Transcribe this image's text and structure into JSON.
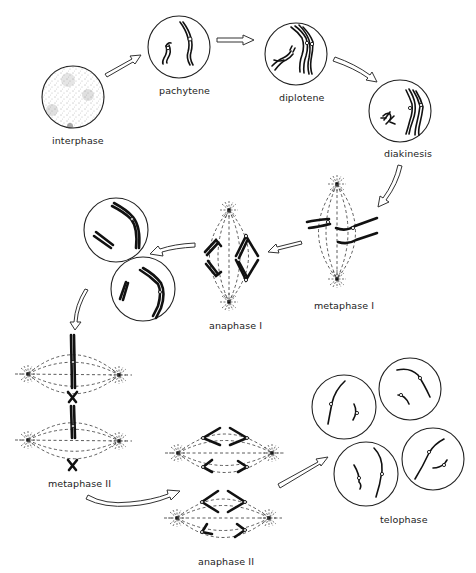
{
  "diagram": {
    "stages": [
      {
        "id": "interphase",
        "label": "interphase"
      },
      {
        "id": "pachytene",
        "label": "pachytene"
      },
      {
        "id": "diplotene",
        "label": "diplotene"
      },
      {
        "id": "diakinesis",
        "label": "diakinesis"
      },
      {
        "id": "metaphase-1",
        "label": "metaphase I"
      },
      {
        "id": "anaphase-1",
        "label": "anaphase I"
      },
      {
        "id": "metaphase-2",
        "label": "metaphase II"
      },
      {
        "id": "anaphase-2",
        "label": "anaphase II"
      },
      {
        "id": "telophase",
        "label": "telophase"
      }
    ],
    "flow": [
      [
        "interphase",
        "pachytene"
      ],
      [
        "pachytene",
        "diplotene"
      ],
      [
        "diplotene",
        "diakinesis"
      ],
      [
        "diakinesis",
        "metaphase-1"
      ],
      [
        "metaphase-1",
        "anaphase-1"
      ],
      [
        "anaphase-1",
        "daughter-cells"
      ],
      [
        "daughter-cells",
        "metaphase-2"
      ],
      [
        "metaphase-2",
        "anaphase-2"
      ],
      [
        "anaphase-2",
        "telophase"
      ]
    ],
    "colors": {
      "ink": "#111111",
      "background": "#ffffff"
    }
  }
}
